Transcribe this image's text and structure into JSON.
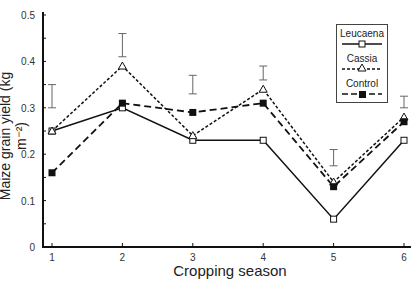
{
  "chart_data": {
    "type": "line",
    "title": "",
    "xlabel": "Cropping season",
    "ylabel": "Maize grain yield (kg m⁻²)",
    "x": [
      1,
      2,
      3,
      4,
      5,
      6
    ],
    "xticks": [
      "1",
      "2",
      "3",
      "4",
      "5",
      "6"
    ],
    "yticks": [
      "0",
      "0.1",
      "0.2",
      "0.3",
      "0.4",
      "0.5"
    ],
    "ylim": [
      0,
      0.5
    ],
    "grid": false,
    "legend_position": "upper right",
    "series": [
      {
        "name": "Leucaena",
        "marker": "open-square",
        "line": "solid",
        "values": [
          0.25,
          0.3,
          0.23,
          0.23,
          0.06,
          0.23
        ]
      },
      {
        "name": "Cassia",
        "marker": "open-triangle",
        "line": "dotted",
        "values": [
          0.25,
          0.39,
          0.24,
          0.34,
          0.14,
          0.28
        ]
      },
      {
        "name": "Control",
        "marker": "filled-square",
        "line": "dashed",
        "values": [
          0.16,
          0.31,
          0.29,
          0.31,
          0.13,
          0.27
        ]
      }
    ],
    "error_bars": [
      {
        "x": 1,
        "low": 0.3,
        "high": 0.35
      },
      {
        "x": 2,
        "low": 0.41,
        "high": 0.46
      },
      {
        "x": 3,
        "low": 0.33,
        "high": 0.37
      },
      {
        "x": 4,
        "low": 0.36,
        "high": 0.39
      },
      {
        "x": 5,
        "low": 0.175,
        "high": 0.21
      },
      {
        "x": 6,
        "low": 0.3,
        "high": 0.325
      }
    ]
  },
  "legend": {
    "items": [
      {
        "label": "Leucaena"
      },
      {
        "label": "Cassia"
      },
      {
        "label": "Control"
      }
    ]
  }
}
